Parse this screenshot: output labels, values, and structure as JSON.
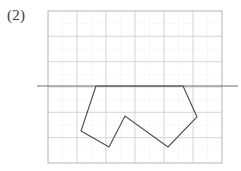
{
  "figure": {
    "label": "(2)",
    "caption_position": "top-left"
  },
  "canvas": {
    "width": 241,
    "height": 171,
    "background": "#ffffff"
  },
  "grid": {
    "x0": 48,
    "y0": 11,
    "x1": 222,
    "y1": 163,
    "major_cols": 6,
    "major_rows": 6,
    "minor_per_major": 2,
    "major_color": "#c9c9cf",
    "minor_color": "#dcdce2",
    "border_color": "#b5b5bb",
    "major_width": 0.8,
    "minor_width": 0.5,
    "minor_dash": "1,1.6"
  },
  "axis_line": {
    "name": "mirror-line",
    "x_start": 37,
    "x_end": 238,
    "y": 86,
    "color": "#6f6f6f",
    "width": 1.2
  },
  "polygon": {
    "name": "reflected-polygon",
    "closed": true,
    "stroke": "#4a4a4a",
    "stroke_width": 1.1,
    "fill": "none",
    "vertices": [
      {
        "x": 96,
        "y": 86
      },
      {
        "x": 81,
        "y": 131
      },
      {
        "x": 109,
        "y": 147
      },
      {
        "x": 125,
        "y": 116
      },
      {
        "x": 168,
        "y": 147
      },
      {
        "x": 197,
        "y": 117
      },
      {
        "x": 183,
        "y": 86
      }
    ]
  },
  "chart_data": {
    "type": "scatter",
    "title": "(2)",
    "xlabel": "",
    "ylabel": "",
    "xlim": [
      0,
      6
    ],
    "ylim": [
      0,
      6
    ],
    "grid": true,
    "legend": "none",
    "annotations": [
      {
        "text": "(2)",
        "x": 7,
        "y": 7,
        "kind": "figure-label"
      }
    ],
    "series": [
      {
        "name": "mirror-line",
        "kind": "line",
        "x": [
          -0.38,
          6.55
        ],
        "y": [
          3.0,
          3.0
        ]
      },
      {
        "name": "polygon-outline",
        "kind": "closed-polyline",
        "x": [
          1.66,
          1.14,
          2.1,
          2.66,
          4.14,
          5.14,
          4.66,
          1.66
        ],
        "y": [
          3.0,
          1.26,
          0.63,
          1.85,
          0.63,
          1.81,
          3.0,
          3.0
        ]
      }
    ]
  }
}
